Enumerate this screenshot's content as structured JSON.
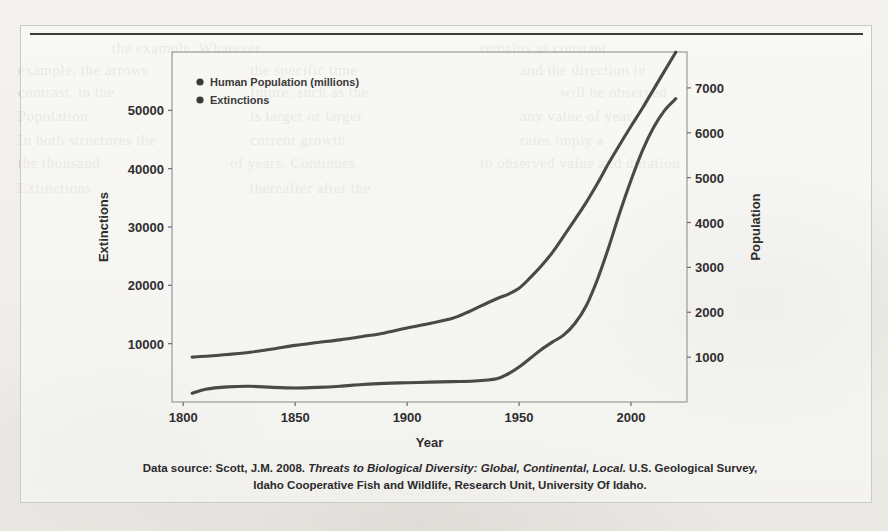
{
  "figure": {
    "caption": {
      "line1_prefix": "Data source: Scott, J.M. 2008. ",
      "line1_italic": "Threats to Biological Diversity: Global, Continental, Local.",
      "line1_suffix": " U.S. Geological Survey,",
      "line2": "Idaho Cooperative Fish and Wildlife, Research Unit, University Of Idaho."
    }
  },
  "ghost_text": [
    {
      "text": "the example. Whatever",
      "x": 112,
      "y": 40,
      "size": 15
    },
    {
      "text": "remains as constant",
      "x": 480,
      "y": 40,
      "size": 15
    },
    {
      "text": "example, the arrows",
      "x": 18,
      "y": 62,
      "size": 15
    },
    {
      "text": "the specific time",
      "x": 250,
      "y": 62,
      "size": 15
    },
    {
      "text": "and the direction in",
      "x": 520,
      "y": 62,
      "size": 15
    },
    {
      "text": "contrast, in the",
      "x": 18,
      "y": 84,
      "size": 15
    },
    {
      "text": "future, such as the",
      "x": 250,
      "y": 84,
      "size": 15
    },
    {
      "text": "will be observed",
      "x": 560,
      "y": 84,
      "size": 15
    },
    {
      "text": "Population",
      "x": 18,
      "y": 108,
      "size": 15
    },
    {
      "text": "is larger or larger",
      "x": 250,
      "y": 108,
      "size": 15
    },
    {
      "text": "any value of year",
      "x": 520,
      "y": 108,
      "size": 15
    },
    {
      "text": "In both structures the",
      "x": 18,
      "y": 132,
      "size": 15
    },
    {
      "text": "current growth",
      "x": 250,
      "y": 132,
      "size": 15
    },
    {
      "text": "rates imply a",
      "x": 520,
      "y": 132,
      "size": 15
    },
    {
      "text": "the thousand",
      "x": 18,
      "y": 155,
      "size": 15
    },
    {
      "text": "of years. Continues",
      "x": 230,
      "y": 155,
      "size": 15
    },
    {
      "text": "to observed value and duration",
      "x": 480,
      "y": 155,
      "size": 15
    },
    {
      "text": "Extinctions",
      "x": 18,
      "y": 180,
      "size": 15
    },
    {
      "text": "thereafter after the",
      "x": 250,
      "y": 180,
      "size": 15
    }
  ],
  "chart_data": {
    "type": "line",
    "title": "",
    "xlabel": "Year",
    "ylabel_left": "Extinctions",
    "ylabel_right": "Population",
    "xlim": [
      1795,
      2025
    ],
    "xticks": [
      "1800",
      "1850",
      "1900",
      "1950",
      "2000"
    ],
    "xtick_values": [
      1800,
      1850,
      1900,
      1950,
      2000
    ],
    "ylim_left": [
      0,
      60000
    ],
    "yticks_left": [
      "10000",
      "20000",
      "30000",
      "40000",
      "50000"
    ],
    "ytick_values_left": [
      10000,
      20000,
      30000,
      40000,
      50000
    ],
    "ylim_right": [
      0,
      7800
    ],
    "yticks_right": [
      "1000",
      "2000",
      "3000",
      "4000",
      "5000",
      "6000",
      "7000"
    ],
    "ytick_values_right": [
      1000,
      2000,
      3000,
      4000,
      5000,
      6000,
      7000
    ],
    "grid": false,
    "legend_position": "top-left",
    "series": [
      {
        "name": "Human Population (millions)",
        "color": "#3a3a3a",
        "axis": "right",
        "x": [
          1804,
          1810,
          1820,
          1830,
          1840,
          1850,
          1860,
          1870,
          1880,
          1890,
          1900,
          1910,
          1920,
          1927,
          1930,
          1940,
          1945,
          1950,
          1955,
          1960,
          1965,
          1970,
          1975,
          1980,
          1985,
          1990,
          1995,
          2000,
          2005,
          2010,
          2015,
          2020
        ],
        "values": [
          1000,
          1020,
          1060,
          1110,
          1180,
          1262,
          1325,
          1385,
          1460,
          1540,
          1650,
          1750,
          1860,
          2000,
          2070,
          2300,
          2400,
          2536,
          2770,
          3035,
          3340,
          3700,
          4070,
          4450,
          4870,
          5320,
          5740,
          6145,
          6540,
          6960,
          7380,
          7795
        ]
      },
      {
        "name": "Extinctions",
        "color": "#3a3a3a",
        "axis": "left",
        "x": [
          1804,
          1810,
          1820,
          1830,
          1840,
          1850,
          1860,
          1870,
          1880,
          1890,
          1900,
          1910,
          1920,
          1930,
          1940,
          1945,
          1950,
          1955,
          1960,
          1965,
          1970,
          1975,
          1980,
          1985,
          1990,
          1995,
          2000,
          2005,
          2010,
          2015,
          2020
        ],
        "values": [
          1500,
          2200,
          2600,
          2700,
          2500,
          2400,
          2500,
          2700,
          3000,
          3200,
          3300,
          3400,
          3500,
          3600,
          4000,
          4800,
          6000,
          7500,
          9000,
          10300,
          11500,
          13500,
          16500,
          21000,
          26500,
          32500,
          38000,
          43000,
          47000,
          50000,
          52000
        ]
      }
    ],
    "legend": [
      {
        "label": "Human Population (millions)",
        "marker": "circle",
        "color": "#3a3a3a"
      },
      {
        "label": "Extinctions",
        "marker": "circle",
        "color": "#3a3a3a"
      }
    ]
  }
}
